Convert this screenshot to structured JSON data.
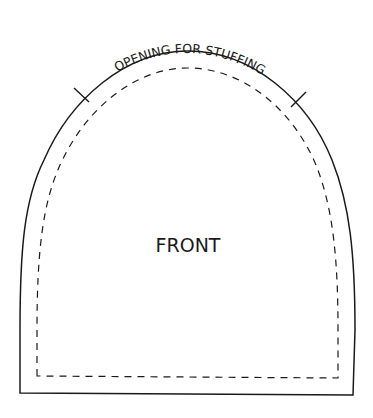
{
  "pattern": {
    "piece_label": "FRONT",
    "opening_label": "OPENING FOR STUFFING",
    "colors": {
      "line": "#1a1a1a",
      "background": "#ffffff"
    },
    "lines": {
      "outer": "cut line (solid)",
      "inner": "seam line (dashed)"
    },
    "notches": 2
  }
}
